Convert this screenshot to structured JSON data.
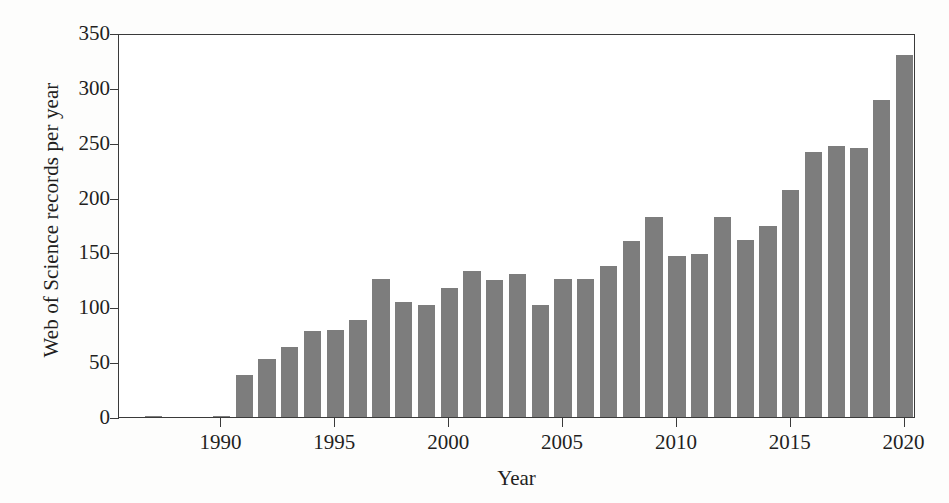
{
  "chart_data": {
    "type": "bar",
    "title": "",
    "xlabel": "Year",
    "ylabel": "Web of Science records per year",
    "xlim": [
      1985.5,
      2020.5
    ],
    "ylim": [
      0,
      350
    ],
    "ytick_values": [
      0,
      50,
      100,
      150,
      200,
      250,
      300,
      350
    ],
    "ytick_labels": [
      "0",
      "50",
      "100",
      "150",
      "200",
      "250",
      "300",
      "350"
    ],
    "xtick_values": [
      1990,
      1995,
      2000,
      2005,
      2010,
      2015,
      2020
    ],
    "xtick_labels": [
      "1990",
      "1995",
      "2000",
      "2005",
      "2010",
      "2015",
      "2020"
    ],
    "grid": false,
    "legend": null,
    "bar_color": "#7d7d7d",
    "axis_color": "#3a3a3a",
    "background_color": "#ffffff",
    "categories": [
      1986,
      1987,
      1988,
      1989,
      1990,
      1991,
      1992,
      1993,
      1994,
      1995,
      1996,
      1997,
      1998,
      1999,
      2000,
      2001,
      2002,
      2003,
      2004,
      2005,
      2006,
      2007,
      2008,
      2009,
      2010,
      2011,
      2012,
      2013,
      2014,
      2015,
      2016,
      2017,
      2018,
      2019,
      2020
    ],
    "values": [
      0,
      1,
      0,
      0,
      1,
      38,
      53,
      64,
      78,
      79,
      88,
      126,
      105,
      102,
      118,
      133,
      125,
      130,
      102,
      126,
      126,
      138,
      160,
      182,
      147,
      149,
      182,
      161,
      174,
      207,
      242,
      247,
      245,
      289,
      330
    ]
  },
  "figure": {
    "width": 949,
    "height": 503
  }
}
